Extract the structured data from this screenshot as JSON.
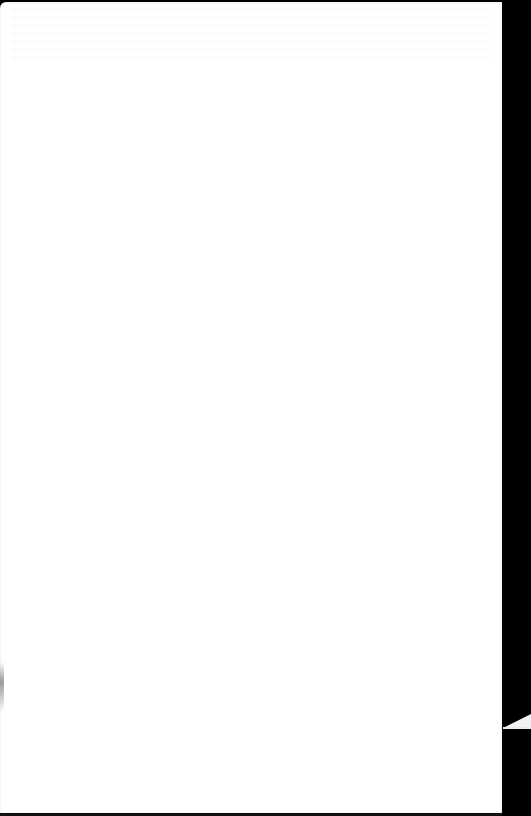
{
  "document": {
    "type": "scanned-page",
    "content_state": "blank",
    "visible_text": "",
    "colors": {
      "paper": "#ffffff",
      "scan_background": "#000000",
      "tear_fragment": "#f2f2f2"
    }
  }
}
